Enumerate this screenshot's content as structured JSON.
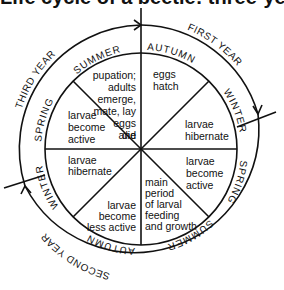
{
  "title": "Life cycle of a beetle: three-year cycle",
  "diagram": {
    "center": [
      141,
      149
    ],
    "inner_radius": 96,
    "outer_radius": 124,
    "line_color": "#111111",
    "segments": [
      {
        "id": "summer-3",
        "lines": [
          "pupation;",
          "adults",
          "emerge,",
          "mate, lay",
          "eggs",
          "and",
          "die"
        ]
      },
      {
        "id": "autumn-1",
        "lines": [
          "eggs",
          "hatch"
        ]
      },
      {
        "id": "winter-1",
        "lines": [
          "larvae",
          "hibernate"
        ]
      },
      {
        "id": "spring-2",
        "lines": [
          "larvae",
          "become",
          "active"
        ]
      },
      {
        "id": "summer-2",
        "lines": [
          "main",
          "period",
          "of larval",
          "feeding",
          "and growth"
        ]
      },
      {
        "id": "autumn-2",
        "lines": [
          "larvae",
          "become",
          "less active"
        ]
      },
      {
        "id": "winter-2",
        "lines": [
          "larvae",
          "hibernate"
        ]
      },
      {
        "id": "spring-3",
        "lines": [
          "larvae",
          "become",
          "active"
        ]
      }
    ],
    "seasons": {
      "summer_top": "SUMMER",
      "autumn_top": "AUTUMN",
      "winter_right": "WINTER",
      "spring_right": "SPRING",
      "summer_bottom": "SUMMER",
      "autumn_bottom": "AUTUMN",
      "winter_left": "WINTER",
      "spring_left": "SPRING"
    },
    "years": {
      "first": "FIRST YEAR",
      "second": "SECOND YEAR",
      "third": "THIRD YEAR"
    }
  }
}
